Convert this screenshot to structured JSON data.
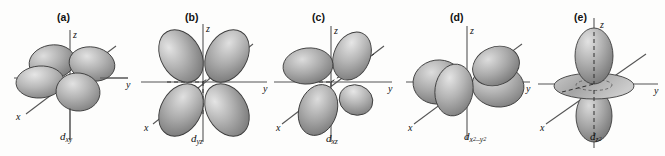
{
  "figure": {
    "type": "d-orbital-shapes-diagram",
    "background_color": "#fdfdfc",
    "lobe_fill_light": "#d6d6d6",
    "lobe_fill_mid": "#a9a9a9",
    "lobe_fill_dark": "#6f6f6f",
    "outline_color": "#3a3a3a",
    "axis_color": "#4a4a4a",
    "panel_count": 5
  },
  "panels": [
    {
      "key": "a",
      "label": "(a)",
      "orbital": {
        "base": "d",
        "sub": "xy",
        "sup": ""
      },
      "orbital_plain": "dxy",
      "description": "four lobes between the x and y axes, viewed in perspective",
      "axes": {
        "x": "x",
        "y": "y",
        "z": "z"
      },
      "lobe_count": 4,
      "has_torus": false
    },
    {
      "key": "b",
      "label": "(b)",
      "orbital": {
        "base": "d",
        "sub": "yz",
        "sup": ""
      },
      "orbital_plain": "dyz",
      "description": "four lobes between the y and z axes, clover shape facing viewer",
      "axes": {
        "x": "x",
        "y": "y",
        "z": "z"
      },
      "lobe_count": 4,
      "has_torus": false
    },
    {
      "key": "c",
      "label": "(c)",
      "orbital": {
        "base": "d",
        "sub": "xz",
        "sup": ""
      },
      "orbital_plain": "dxz",
      "description": "four lobes between the x and z axes",
      "axes": {
        "x": "x",
        "y": "y",
        "z": "z"
      },
      "lobe_count": 4,
      "has_torus": false
    },
    {
      "key": "d",
      "label": "(d)",
      "orbital": {
        "base": "d",
        "sub": "x",
        "sup": "2",
        "sub2": "–y",
        "sup2": "2"
      },
      "orbital_plain": "dx2-y2",
      "description": "four lobes lying along the x and y axes",
      "axes": {
        "x": "x",
        "y": "y",
        "z": "z"
      },
      "lobe_count": 4,
      "has_torus": false
    },
    {
      "key": "e",
      "label": "(e)",
      "orbital": {
        "base": "d",
        "sub": "z",
        "sup": "2"
      },
      "orbital_plain": "dz2",
      "description": "two lobes along the z axis with a doughnut-shaped torus in the xy plane",
      "axes": {
        "x": "x",
        "y": "y",
        "z": "z"
      },
      "lobe_count": 2,
      "has_torus": true
    }
  ]
}
